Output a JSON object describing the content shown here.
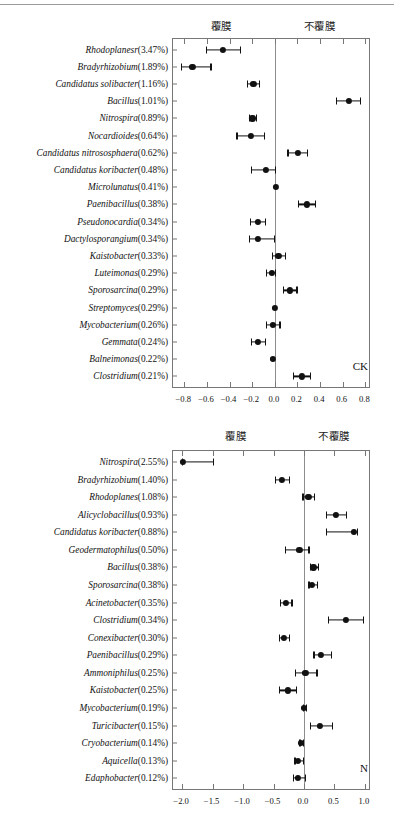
{
  "figure": {
    "type": "forest-plot-pair",
    "axis_header_left": "覆膜",
    "axis_header_right": "不覆膜"
  },
  "chart_data": [
    {
      "id": "ck",
      "type": "scatter",
      "title": "",
      "panel_tag": "CK",
      "header_left": "覆膜",
      "header_right": "不覆膜",
      "xlabel": "",
      "ylabel": "",
      "xlim": [
        -0.9,
        0.85
      ],
      "xticks": [
        -0.8,
        -0.6,
        -0.4,
        -0.2,
        0.0,
        0.2,
        0.4,
        0.6,
        0.8
      ],
      "xticklabels": [
        "−0.8",
        "−0.6",
        "−0.4",
        "−0.2",
        "0.0",
        "0.2",
        "0.4",
        "0.6",
        "0.8"
      ],
      "grid": false,
      "zero_reference": 0.0,
      "categories": [
        "Rhodoplanesr(3.47%)",
        "Bradyrhizobium(1.89%)",
        "Candidatus solibacter(1.16%)",
        "Bacillus(1.01%)",
        "Nitrospira(0.89%)",
        "Nocardioides(0.64%)",
        "Candidatus nitrososphaera(0.62%)",
        "Candidatus koribacter(0.48%)",
        "Microlunatus(0.41%)",
        "Paenibacillus(0.38%)",
        "Pseudonocardia(0.34%)",
        "Dactylosporangium(0.34%)",
        "Kaistobacter(0.33%)",
        "Luteimonas(0.29%)",
        "Sporosarcina(0.29%)",
        "Streptomyces(0.29%)",
        "Mycobacterium(0.26%)",
        "Gemmata(0.24%)",
        "Balneimonas(0.22%)",
        "Clostridium(0.21%)"
      ],
      "taxa": [
        {
          "name": "Rhodoplanesr",
          "abundance": "3.47%",
          "value": -0.45,
          "lo": -0.6,
          "hi": -0.3
        },
        {
          "name": "Bradyrhizobium",
          "abundance": "1.89%",
          "value": -0.72,
          "lo": -0.82,
          "hi": -0.56
        },
        {
          "name": "Candidatus solibacter",
          "abundance": "1.16%",
          "value": -0.18,
          "lo": -0.24,
          "hi": -0.13
        },
        {
          "name": "Bacillus",
          "abundance": "1.01%",
          "value": 0.66,
          "lo": 0.55,
          "hi": 0.76
        },
        {
          "name": "Nitrospira",
          "abundance": "0.89%",
          "value": -0.19,
          "lo": -0.22,
          "hi": -0.16
        },
        {
          "name": "Nocardioides",
          "abundance": "0.64%",
          "value": -0.2,
          "lo": -0.33,
          "hi": -0.09
        },
        {
          "name": "Candidatus nitrososphaera",
          "abundance": "0.62%",
          "value": 0.21,
          "lo": 0.12,
          "hi": 0.29
        },
        {
          "name": "Candidatus koribacter",
          "abundance": "0.48%",
          "value": -0.07,
          "lo": -0.2,
          "hi": 0.01
        },
        {
          "name": "Microlunatus",
          "abundance": "0.41%",
          "value": 0.02,
          "lo": 0.02,
          "hi": 0.02
        },
        {
          "name": "Paenibacillus",
          "abundance": "0.38%",
          "value": 0.29,
          "lo": 0.21,
          "hi": 0.36
        },
        {
          "name": "Pseudonocardia",
          "abundance": "0.34%",
          "value": -0.14,
          "lo": -0.21,
          "hi": -0.08
        },
        {
          "name": "Dactylosporangium",
          "abundance": "0.34%",
          "value": -0.14,
          "lo": -0.22,
          "hi": 0.0
        },
        {
          "name": "Kaistobacter",
          "abundance": "0.33%",
          "value": 0.04,
          "lo": -0.02,
          "hi": 0.1
        },
        {
          "name": "Luteimonas",
          "abundance": "0.29%",
          "value": -0.02,
          "lo": -0.07,
          "hi": 0.01
        },
        {
          "name": "Sporosarcina",
          "abundance": "0.29%",
          "value": 0.14,
          "lo": 0.08,
          "hi": 0.2
        },
        {
          "name": "Streptomyces",
          "abundance": "0.29%",
          "value": 0.01,
          "lo": 0.01,
          "hi": 0.01
        },
        {
          "name": "Mycobacterium",
          "abundance": "0.26%",
          "value": -0.01,
          "lo": -0.07,
          "hi": 0.05
        },
        {
          "name": "Gemmata",
          "abundance": "0.24%",
          "value": -0.14,
          "lo": -0.2,
          "hi": -0.08
        },
        {
          "name": "Balneimonas",
          "abundance": "0.22%",
          "value": -0.01,
          "lo": -0.01,
          "hi": -0.01
        },
        {
          "name": "Clostridium",
          "abundance": "0.21%",
          "value": 0.25,
          "lo": 0.17,
          "hi": 0.32
        }
      ]
    },
    {
      "id": "n",
      "type": "scatter",
      "title": "",
      "panel_tag": "N",
      "header_left": "覆膜",
      "header_right": "不覆膜",
      "xlabel": "",
      "ylabel": "",
      "xlim": [
        -2.15,
        1.1
      ],
      "xticks": [
        -2.0,
        -1.5,
        -1.0,
        -0.5,
        0.0,
        0.5,
        1.0
      ],
      "xticklabels": [
        "−2.0",
        "−1.5",
        "−1.0",
        "−0.5",
        "0.0",
        "0.5",
        "1.0"
      ],
      "grid": false,
      "zero_reference": 0.0,
      "categories": [
        "Nitrospira(2.55%)",
        "Bradyrhizobium(1.40%)",
        "Rhodoplanes(1.08%)",
        "Alicyclobacillus(0.93%)",
        "Candidatus koribacter(0.88%)",
        "Geodermatophilus(0.50%)",
        "Bacillus(0.38%)",
        "Sporosarcina(0.38%)",
        "Acinetobacter(0.35%)",
        "Clostridium(0.34%)",
        "Conexibacter(0.30%)",
        "Paenibacillus(0.29%)",
        "Ammoniphilus(0.25%)",
        "Kaistobacter(0.25%)",
        "Mycobacterium(0.19%)",
        "Turicibacter(0.15%)",
        "Cryobacterium(0.14%)",
        "Aquicella(0.13%)",
        "Edaphobacter(0.12%)"
      ],
      "taxa": [
        {
          "name": "Nitrospira",
          "abundance": "2.55%",
          "value": -1.97,
          "lo": -1.99,
          "hi": -1.48
        },
        {
          "name": "Bradyrhizobium",
          "abundance": "1.40%",
          "value": -0.34,
          "lo": -0.46,
          "hi": -0.23
        },
        {
          "name": "Rhodoplanes",
          "abundance": "1.08%",
          "value": 0.09,
          "lo": -0.01,
          "hi": 0.18
        },
        {
          "name": "Alicyclobacillus",
          "abundance": "0.93%",
          "value": 0.54,
          "lo": 0.38,
          "hi": 0.7
        },
        {
          "name": "Candidatus koribacter",
          "abundance": "0.88%",
          "value": 0.84,
          "lo": 0.38,
          "hi": 0.88
        },
        {
          "name": "Geodermatophilus",
          "abundance": "0.50%",
          "value": -0.06,
          "lo": -0.3,
          "hi": 0.09
        },
        {
          "name": "Bacillus",
          "abundance": "0.38%",
          "value": 0.17,
          "lo": 0.12,
          "hi": 0.24
        },
        {
          "name": "Sporosarcina",
          "abundance": "0.38%",
          "value": 0.15,
          "lo": 0.09,
          "hi": 0.23
        },
        {
          "name": "Acinetobacter",
          "abundance": "0.35%",
          "value": -0.28,
          "lo": -0.38,
          "hi": -0.19
        },
        {
          "name": "Clostridium",
          "abundance": "0.34%",
          "value": 0.7,
          "lo": 0.41,
          "hi": 0.99
        },
        {
          "name": "Conexibacter",
          "abundance": "0.30%",
          "value": -0.31,
          "lo": -0.4,
          "hi": -0.23
        },
        {
          "name": "Paenibacillus",
          "abundance": "0.29%",
          "value": 0.29,
          "lo": 0.17,
          "hi": 0.46
        },
        {
          "name": "Ammoniphilus",
          "abundance": "0.25%",
          "value": 0.04,
          "lo": -0.13,
          "hi": 0.22
        },
        {
          "name": "Kaistobacter",
          "abundance": "0.25%",
          "value": -0.25,
          "lo": -0.4,
          "hi": -0.11
        },
        {
          "name": "Mycobacterium",
          "abundance": "0.19%",
          "value": 0.02,
          "lo": 0.0,
          "hi": 0.05
        },
        {
          "name": "Turicibacter",
          "abundance": "0.15%",
          "value": 0.28,
          "lo": 0.11,
          "hi": 0.47
        },
        {
          "name": "Cryobacterium",
          "abundance": "0.14%",
          "value": -0.03,
          "lo": -0.06,
          "hi": 0.0
        },
        {
          "name": "Aquicella",
          "abundance": "0.13%",
          "value": -0.08,
          "lo": -0.14,
          "hi": 0.0
        },
        {
          "name": "Edaphobacter",
          "abundance": "0.12%",
          "value": -0.08,
          "lo": -0.17,
          "hi": 0.03
        }
      ]
    }
  ]
}
